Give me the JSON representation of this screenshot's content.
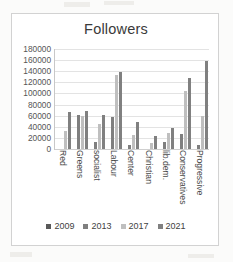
{
  "chart_data": {
    "type": "bar",
    "title": "Followers",
    "xlabel": "",
    "ylabel": "",
    "ylim": [
      0,
      180000
    ],
    "ytick_step": 20000,
    "yticks": [
      "180000",
      "160000",
      "140000",
      "120000",
      "100000",
      "80000",
      "60000",
      "40000",
      "20000",
      "0"
    ],
    "grid": true,
    "legend_position": "bottom",
    "categories": [
      "Red",
      "Greens",
      "socialist",
      "Labour",
      "Center",
      "Christian",
      "lib.dem.",
      "Conservatives",
      "Progressive"
    ],
    "series": [
      {
        "name": "2009",
        "color": "#595959",
        "values": [
          null,
          null,
          null,
          null,
          null,
          null,
          null,
          null,
          null
        ]
      },
      {
        "name": "2013",
        "color": "#7f7f7f",
        "values": [
          null,
          61000,
          13000,
          58000,
          7000,
          null,
          13000,
          27000,
          8000
        ]
      },
      {
        "name": "2017",
        "color": "#bfbfbf",
        "values": [
          33000,
          60000,
          45000,
          133000,
          25000,
          11000,
          28000,
          105000,
          60000
        ]
      },
      {
        "name": "2021",
        "color": "#808080",
        "values": [
          67000,
          68000,
          62000,
          138000,
          48000,
          23000,
          37000,
          127000,
          158000
        ]
      }
    ]
  },
  "legend": {
    "items": [
      {
        "label": "2009",
        "color": "#595959"
      },
      {
        "label": "2013",
        "color": "#7f7f7f"
      },
      {
        "label": "2017",
        "color": "#bfbfbf"
      },
      {
        "label": "2021",
        "color": "#808080"
      }
    ]
  },
  "colors": {
    "grid": "#e3e3e3",
    "axis": "#c8c8c8",
    "text": "#3f3f3f",
    "card_border": "#d2d2d2",
    "background": "#ffffff"
  }
}
